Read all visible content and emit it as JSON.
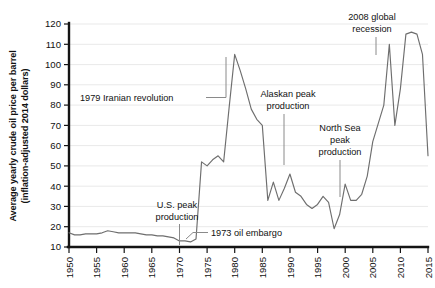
{
  "chart_data": {
    "type": "line",
    "title": "",
    "xlabel": "",
    "ylabel": "Average yearly crude oil price per barrel (inflation-adjusted 2014 dollars)",
    "ylabel_line1": "Average yearly crude oil price per barrel",
    "ylabel_line2": "(inflation-adjusted 2014 dollars)",
    "xlim": [
      1950,
      2015
    ],
    "ylim": [
      10,
      120
    ],
    "grid": true,
    "legend": "none",
    "line_color": "#6e6e6e",
    "grid_color": "#e9e9e9",
    "axis_color": "#141414",
    "yticks": [
      10,
      20,
      30,
      40,
      50,
      60,
      70,
      80,
      90,
      100,
      110,
      120
    ],
    "ytick_labels": [
      "10",
      "20",
      "30",
      "40",
      "50",
      "60",
      "70",
      "80",
      "90",
      "100",
      "110",
      "120"
    ],
    "xticks": [
      1950,
      1955,
      1960,
      1965,
      1970,
      1975,
      1980,
      1985,
      1990,
      1995,
      2000,
      2005,
      2010,
      2015
    ],
    "xtick_labels": [
      "1950",
      "1955",
      "1960",
      "1965",
      "1970",
      "1975",
      "1980",
      "1985",
      "1990",
      "1995",
      "2000",
      "2005",
      "2010",
      "2015"
    ],
    "x": [
      1950,
      1951,
      1952,
      1953,
      1954,
      1955,
      1956,
      1957,
      1958,
      1959,
      1960,
      1961,
      1962,
      1963,
      1964,
      1965,
      1966,
      1967,
      1968,
      1969,
      1970,
      1971,
      1972,
      1973,
      1974,
      1975,
      1976,
      1977,
      1978,
      1979,
      1980,
      1981,
      1982,
      1983,
      1984,
      1985,
      1986,
      1987,
      1988,
      1989,
      1990,
      1991,
      1992,
      1993,
      1994,
      1995,
      1996,
      1997,
      1998,
      1999,
      2000,
      2001,
      2002,
      2003,
      2004,
      2005,
      2006,
      2007,
      2008,
      2009,
      2010,
      2011,
      2012,
      2013,
      2014,
      2015
    ],
    "values": [
      17,
      16,
      16,
      16.5,
      16.5,
      16.5,
      17,
      18,
      17.5,
      17,
      17,
      17,
      17,
      16.5,
      16,
      16,
      15.5,
      15.5,
      15,
      14.5,
      13,
      13,
      12.5,
      14,
      52,
      50,
      53,
      55,
      52,
      79,
      105,
      97,
      88,
      78,
      73,
      70,
      33,
      42,
      33,
      39,
      46,
      37,
      35,
      31,
      29,
      31,
      35,
      32,
      19,
      26,
      41,
      33,
      33,
      36,
      45,
      62,
      71,
      80,
      110,
      70,
      88,
      115,
      116,
      115,
      105,
      55
    ],
    "annotations": [
      {
        "id": "iranian-revolution",
        "text": "1979 Iranian revolution",
        "lines": [
          "1979 Iranian revolution"
        ],
        "target_year": 1979,
        "leader": "horizontal-right"
      },
      {
        "id": "us-peak-production",
        "text": "U.S. peak production",
        "lines": [
          "U.S. peak",
          "production"
        ],
        "target_year": 1970,
        "leader": "vertical-down"
      },
      {
        "id": "oil-embargo-1973",
        "text": "1973 oil embargo",
        "lines": [
          "1973 oil embargo"
        ],
        "target_year": 1973,
        "leader": "horizontal-left"
      },
      {
        "id": "alaskan-peak-production",
        "text": "Alaskan peak production",
        "lines": [
          "Alaskan peak",
          "production"
        ],
        "target_year": 1988,
        "leader": "vertical-down"
      },
      {
        "id": "north-sea-peak-production",
        "text": "North Sea peak production",
        "lines": [
          "North Sea",
          "peak",
          "production"
        ],
        "target_year": 1999,
        "leader": "vertical-down"
      },
      {
        "id": "global-recession-2008",
        "text": "2008 global recession",
        "lines": [
          "2008 global",
          "recession"
        ],
        "target_year": 2008,
        "leader": "vertical-down"
      }
    ]
  }
}
